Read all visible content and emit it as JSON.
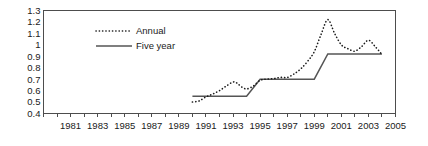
{
  "chart_data": {
    "type": "line",
    "title": "",
    "xlabel": "",
    "ylabel": "",
    "xlim": [
      1979,
      2005
    ],
    "ylim": [
      0.4,
      1.3
    ],
    "grid": false,
    "legend_position": "top-left-inside",
    "y_ticks": [
      "1.3",
      "1.2",
      "1.1",
      "1",
      "0.9",
      "0.8",
      "0.7",
      "0.6",
      "0.5",
      "0.4"
    ],
    "y_tick_values": [
      1.3,
      1.2,
      1.1,
      1.0,
      0.9,
      0.8,
      0.7,
      0.6,
      0.5,
      0.4
    ],
    "x_ticks": [
      "1981",
      "1983",
      "1985",
      "1987",
      "1989",
      "1991",
      "1993",
      "1995",
      "1997",
      "1999",
      "2001",
      "2003",
      "2005"
    ],
    "x_tick_values": [
      1981,
      1983,
      1985,
      1987,
      1989,
      1991,
      1993,
      1995,
      1997,
      1999,
      2001,
      2003,
      2005
    ],
    "x_minor_tick_values": [
      1979,
      1980,
      1981,
      1982,
      1983,
      1984,
      1985,
      1986,
      1987,
      1988,
      1989,
      1990,
      1991,
      1992,
      1993,
      1994,
      1995,
      1996,
      1997,
      1998,
      1999,
      2000,
      2001,
      2002,
      2003,
      2004,
      2005
    ],
    "series": [
      {
        "name": "Annual",
        "style": "dotted",
        "color": "#1a1a1a",
        "x": [
          1990.0,
          1990.5,
          1991.0,
          1991.5,
          1992.0,
          1992.5,
          1993.0,
          1993.3,
          1993.6,
          1994.0,
          1994.5,
          1995.0,
          1995.5,
          1996.0,
          1996.5,
          1997.0,
          1997.5,
          1998.0,
          1998.5,
          1999.0,
          1999.5,
          2000.0,
          2000.5,
          2001.0,
          2001.5,
          2002.0,
          2002.5,
          2003.0,
          2003.5,
          2004.0
        ],
        "values": [
          0.5,
          0.51,
          0.545,
          0.57,
          0.6,
          0.64,
          0.675,
          0.665,
          0.635,
          0.615,
          0.64,
          0.69,
          0.7,
          0.705,
          0.715,
          0.715,
          0.745,
          0.79,
          0.855,
          0.94,
          1.09,
          1.22,
          1.1,
          1.0,
          0.965,
          0.945,
          0.985,
          1.04,
          0.985,
          0.915
        ]
      },
      {
        "name": "Five year",
        "style": "solid",
        "color": "#555555",
        "x": [
          1990.0,
          1994.0,
          1995.0,
          1999.0,
          2000.0,
          2004.0
        ],
        "values": [
          0.55,
          0.55,
          0.7,
          0.7,
          0.92,
          0.92
        ]
      }
    ]
  },
  "legend": {
    "entries": [
      {
        "label": "Annual",
        "style": "dotted"
      },
      {
        "label": "Five year",
        "style": "solid"
      }
    ]
  },
  "colors": {
    "annual": "#1a1a1a",
    "five_year": "#555555",
    "frame": "#4d4d4d",
    "background": "#ffffff"
  }
}
